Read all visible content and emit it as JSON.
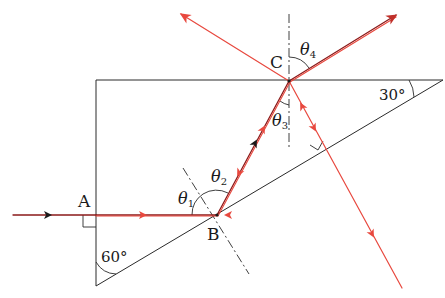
{
  "diagram": {
    "title": "",
    "type": "ray-optics-prism",
    "colors": {
      "outline": "#2a2a2a",
      "ray_red": "#e8483e",
      "ray_dark": "#8b1a1a",
      "arrow_dark": "#1a1a1a"
    },
    "points": {
      "A": {
        "label": "A"
      },
      "B": {
        "label": "B"
      },
      "C": {
        "label": "C"
      }
    },
    "angles": {
      "top_right": "30°",
      "bottom_left": "60°",
      "theta1": {
        "base": "θ",
        "sub": "1"
      },
      "theta2": {
        "base": "θ",
        "sub": "2"
      },
      "theta3": {
        "base": "θ",
        "sub": "3"
      },
      "theta4": {
        "base": "θ",
        "sub": "4"
      }
    },
    "elements": [
      "right-triangle prism with 30° and 60° angles, right angle at top-left",
      "incident ray enters at A normally, travels to B on hypotenuse",
      "dash-dot normals at B and C",
      "ray reflects at B toward C on top face",
      "at C: refracted ray to upper-right, reflected ray to upper-left, ray down-right perpendicular to hypotenuse",
      "right-angle markers at A and at hypotenuse exit"
    ]
  }
}
